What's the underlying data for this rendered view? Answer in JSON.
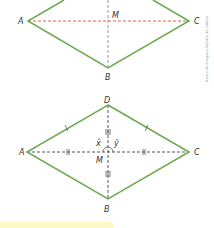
{
  "figure_1": {
    "shape": "rhombus",
    "vertices": {
      "A": "A",
      "B": "B",
      "C": "C"
    },
    "center": "M",
    "colors": {
      "sides": "#6aa84f",
      "diagonal_AC": "#e06040",
      "diagonal_BD": "#999999"
    }
  },
  "figure_2": {
    "shape": "rhombus",
    "vertices": {
      "A": "A",
      "B": "B",
      "C": "C",
      "D": "D"
    },
    "center": "M",
    "angles": {
      "x": "x̂",
      "y": "ŷ"
    },
    "colors": {
      "sides": "#6aa84f",
      "diagonals": "#555555"
    }
  },
  "credit": "Banco de imagens/Arquivo da editora"
}
